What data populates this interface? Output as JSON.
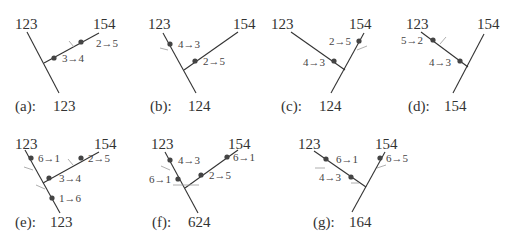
{
  "figure": {
    "panels": [
      {
        "id": "a",
        "caption_tag": "(a):",
        "caption_value": "123",
        "leaf_left": "123",
        "leaf_right": "154",
        "mutations": [
          "3→4",
          "2→5"
        ]
      },
      {
        "id": "b",
        "caption_tag": "(b):",
        "caption_value": "124",
        "leaf_left": "123",
        "leaf_right": "154",
        "mutations": [
          "4→3",
          "2→5"
        ]
      },
      {
        "id": "c",
        "caption_tag": "(c):",
        "caption_value": "124",
        "leaf_left": "123",
        "leaf_right": "154",
        "mutations": [
          "4→3",
          "2→5"
        ]
      },
      {
        "id": "d",
        "caption_tag": "(d):",
        "caption_value": "154",
        "leaf_left": "123",
        "leaf_right": "154",
        "mutations": [
          "5→2",
          "4→3"
        ]
      },
      {
        "id": "e",
        "caption_tag": "(e):",
        "caption_value": "123",
        "leaf_left": "123",
        "leaf_right": "154",
        "mutations": [
          "6→1",
          "2→5",
          "3→4",
          "1→6"
        ]
      },
      {
        "id": "f",
        "caption_tag": "(f):",
        "caption_value": "624",
        "leaf_left": "123",
        "leaf_right": "154",
        "mutations": [
          "4→3",
          "6→1",
          "6→1",
          "2→5"
        ]
      },
      {
        "id": "g",
        "caption_tag": "(g):",
        "caption_value": "164",
        "leaf_left": "123",
        "leaf_right": "154",
        "mutations": [
          "6→1",
          "4→3",
          "6→5"
        ]
      }
    ]
  }
}
